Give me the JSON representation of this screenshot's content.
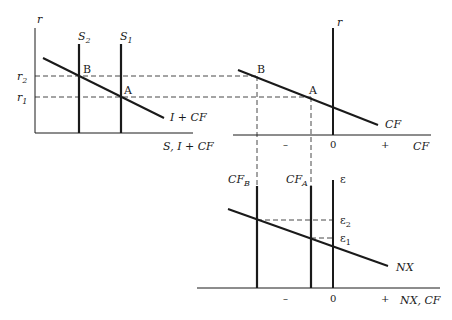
{
  "panels": {
    "left": {
      "y_axis_label": "r",
      "x_axis_label": "S, I + CF",
      "curves": {
        "s2": "S",
        "s2_sub": "2",
        "s1": "S",
        "s1_sub": "1",
        "demand": "I + CF"
      },
      "y_ticks": {
        "r2": "r",
        "r2_sub": "2",
        "r1": "r",
        "r1_sub": "1"
      },
      "points": {
        "b": "B",
        "a": "A"
      }
    },
    "top_right": {
      "y_axis_label": "r",
      "x_axis_label": "CF",
      "curve": "CF",
      "points": {
        "b": "B",
        "a": "A"
      },
      "x_ticks": {
        "minus": "–",
        "zero": "0",
        "plus": "+"
      }
    },
    "bottom": {
      "y_axis_label": "ε",
      "x_axis_label": "NX, CF",
      "curve": "NX",
      "verticals": {
        "cfb": "CF",
        "cfb_sub": "B",
        "cfa": "CF",
        "cfa_sub": "A"
      },
      "y_ticks": {
        "e2": "ε",
        "e2_sub": "2",
        "e1": "ε",
        "e1_sub": "1"
      },
      "x_ticks": {
        "minus": "–",
        "zero": "0",
        "plus": "+"
      }
    }
  },
  "colors": {
    "ink": "#1a1a1a",
    "background": "#ffffff"
  }
}
